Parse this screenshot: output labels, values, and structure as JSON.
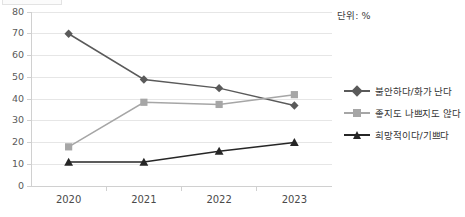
{
  "unit_label": "단위: %",
  "legend": {
    "items": [
      {
        "label": "불안하다/화가 난다",
        "marker": "diamond",
        "color": "#5a5a5a"
      },
      {
        "label": "좋지도 나쁘지도 않다",
        "marker": "square",
        "color": "#a6a6a6"
      },
      {
        "label": "희망적이다/기쁘다",
        "marker": "triangle",
        "color": "#262626"
      }
    ]
  },
  "chart_data": {
    "type": "line",
    "title": "",
    "xlabel": "",
    "ylabel": "",
    "ylim": [
      0,
      80
    ],
    "ytick_step": 10,
    "yticks": [
      0,
      10,
      20,
      30,
      40,
      50,
      60,
      70,
      80
    ],
    "grid": "horizontal",
    "legend_position": "right",
    "categories": [
      "2020",
      "2021",
      "2022",
      "2023"
    ],
    "series": [
      {
        "name": "불안하다/화가 난다",
        "values": [
          70,
          49,
          45,
          37
        ],
        "color": "#5a5a5a",
        "marker": "diamond"
      },
      {
        "name": "좋지도 나쁘지도 않다",
        "values": [
          18,
          38.5,
          37.5,
          42
        ],
        "color": "#a6a6a6",
        "marker": "square"
      },
      {
        "name": "희망적이다/기쁘다",
        "values": [
          11,
          11,
          16,
          20
        ],
        "color": "#262626",
        "marker": "triangle"
      }
    ]
  }
}
